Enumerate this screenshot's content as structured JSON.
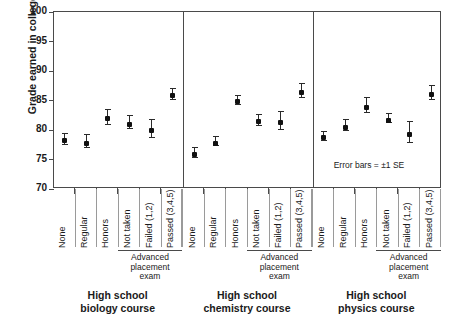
{
  "chart_data": {
    "type": "scatter",
    "title": "",
    "xlabel": "",
    "ylabel": "Grade earned in college course",
    "ylim": [
      70,
      100
    ],
    "yticks": [
      70,
      75,
      80,
      85,
      90,
      95,
      100
    ],
    "grid": false,
    "legend": null,
    "annotations": [
      "Error bars = ±1 SE"
    ],
    "error_bar_meaning": "±1 SE",
    "categories": [
      "None",
      "Regular",
      "Honors",
      "Not taken",
      "Failed (1,2)",
      "Passed (3,4,5)"
    ],
    "panels": [
      {
        "name": "High school biology course",
        "caption_line1": "High school",
        "caption_line2": "biology course",
        "subgroup_label": "Advanced placement exam",
        "subgroup_lines": [
          "Advanced",
          "placement",
          "exam"
        ],
        "subgroup_categories": [
          "Not taken",
          "Failed (1,2)",
          "Passed (3,4,5)"
        ],
        "points": [
          {
            "category": "None",
            "value": 78.6,
            "se": 0.9
          },
          {
            "category": "Regular",
            "value": 78.2,
            "se": 1.1
          },
          {
            "category": "Honors",
            "value": 82.3,
            "se": 1.3
          },
          {
            "category": "Not taken",
            "value": 81.4,
            "se": 1.1
          },
          {
            "category": "Failed (1,2)",
            "value": 80.3,
            "se": 1.5
          },
          {
            "category": "Passed (3,4,5)",
            "value": 86.2,
            "se": 1.0
          }
        ]
      },
      {
        "name": "High school chemistry course",
        "caption_line1": "High school",
        "caption_line2": "chemistry course",
        "subgroup_label": "Advanced placement exam",
        "subgroup_lines": [
          "Advanced",
          "placement",
          "exam"
        ],
        "subgroup_categories": [
          "Not taken",
          "Failed (1,2)",
          "Passed (3,4,5)"
        ],
        "points": [
          {
            "category": "None",
            "value": 76.3,
            "se": 0.9
          },
          {
            "category": "Regular",
            "value": 78.2,
            "se": 0.8
          },
          {
            "category": "Honors",
            "value": 85.2,
            "se": 0.8
          },
          {
            "category": "Not taken",
            "value": 81.8,
            "se": 0.9
          },
          {
            "category": "Failed (1,2)",
            "value": 81.7,
            "se": 1.5
          },
          {
            "category": "Passed (3,4,5)",
            "value": 86.8,
            "se": 1.2
          }
        ]
      },
      {
        "name": "High school physics course",
        "caption_line1": "High school",
        "caption_line2": "physics course",
        "subgroup_label": "Advanced placement exam",
        "subgroup_lines": [
          "Advanced",
          "placement",
          "exam"
        ],
        "subgroup_categories": [
          "Not taken",
          "Failed (1,2)",
          "Passed (3,4,5)"
        ],
        "points": [
          {
            "category": "None",
            "value": 79.1,
            "se": 0.8
          },
          {
            "category": "Regular",
            "value": 80.9,
            "se": 0.9
          },
          {
            "category": "Honors",
            "value": 84.3,
            "se": 1.3
          },
          {
            "category": "Not taken",
            "value": 82.1,
            "se": 0.8
          },
          {
            "category": "Failed (1,2)",
            "value": 79.7,
            "se": 1.8
          },
          {
            "category": "Passed (3,4,5)",
            "value": 86.4,
            "se": 1.2
          }
        ]
      }
    ]
  },
  "colors": {
    "marker": "#111111",
    "axis": "#4a4a4a",
    "text": "#1a1a1a",
    "background": "#ffffff"
  }
}
